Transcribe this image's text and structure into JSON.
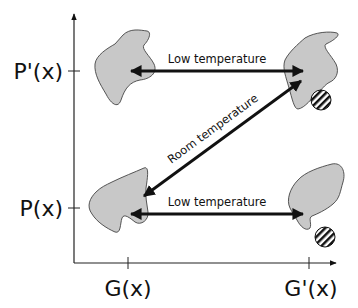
{
  "diagram": {
    "axes": {
      "y_ticks": [
        {
          "label": "P'(x)",
          "y": 71
        },
        {
          "label": "P(x)",
          "y": 208
        }
      ],
      "x_ticks": [
        {
          "label": "G(x)",
          "x": 128
        },
        {
          "label": "G'(x)",
          "x": 309
        }
      ]
    },
    "arrows": {
      "top": {
        "label": "Low temperature",
        "direction": "bidirectional"
      },
      "bottom": {
        "label": "Low temperature",
        "direction": "bidirectional"
      },
      "diagonal": {
        "label": "Room temperature",
        "direction": "bidirectional"
      }
    },
    "shapes": [
      {
        "name": "protein-blob",
        "position": "top-left",
        "ligand": false
      },
      {
        "name": "protein-blob",
        "position": "top-right",
        "ligand": true
      },
      {
        "name": "protein-blob",
        "position": "bottom-left",
        "ligand": false
      },
      {
        "name": "protein-blob",
        "position": "bottom-right",
        "ligand": true
      }
    ],
    "colors": {
      "blob_fill": "#c8c8c8",
      "blob_stroke": "#444444",
      "arrow": "#111111",
      "axis": "#222222"
    }
  }
}
